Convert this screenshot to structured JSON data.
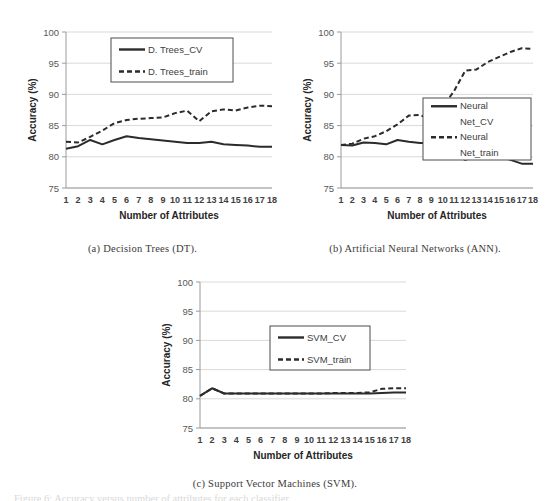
{
  "figure": {
    "subcaption_a": "(a) Decision Trees (DT).",
    "subcaption_b": "(b) Artificial Neural Networks (ANN).",
    "subcaption_c": "(c) Support Vector Machines (SVM).",
    "bottom_cut_text": "Figure 6: Accuracy versus number of attributes for each classifier."
  },
  "chart_data": [
    {
      "id": "dt",
      "type": "line",
      "title": "(a) Decision Trees (DT).",
      "xlabel": "Number of Attributes",
      "ylabel": "Accuracy (%)",
      "xlim": [
        1,
        18
      ],
      "ylim": [
        75,
        100
      ],
      "yticks": [
        75,
        80,
        85,
        90,
        95,
        100
      ],
      "ytick_labels": [
        "75",
        "80",
        "85",
        "90",
        "95",
        "100"
      ],
      "x": [
        1,
        2,
        3,
        4,
        5,
        6,
        7,
        8,
        9,
        10,
        11,
        12,
        13,
        14,
        15,
        16,
        17,
        18
      ],
      "xtick_labels": [
        "1",
        "2",
        "3",
        "4",
        "5",
        "6",
        "7",
        "8",
        "9",
        "10",
        "11",
        "12",
        "13",
        "14",
        "15",
        "16",
        "17",
        "18"
      ],
      "grid": "horizontal",
      "legend_position": "upper-center",
      "series": [
        {
          "name": "D. Trees_CV",
          "style": "solid",
          "color": "#2b2b2b",
          "values": [
            81.3,
            81.7,
            82.7,
            82.0,
            82.7,
            83.3,
            83.0,
            82.8,
            82.6,
            82.4,
            82.2,
            82.2,
            82.4,
            82.0,
            81.9,
            81.8,
            81.6,
            81.6
          ]
        },
        {
          "name": "D. Trees_train",
          "style": "dashed",
          "color": "#2b2b2b",
          "values": [
            82.4,
            82.3,
            83.2,
            84.2,
            85.4,
            85.9,
            86.1,
            86.2,
            86.3,
            87.0,
            87.4,
            85.7,
            87.3,
            87.6,
            87.4,
            87.9,
            88.2,
            88.1
          ]
        }
      ]
    },
    {
      "id": "ann",
      "type": "line",
      "title": "(b) Artificial Neural Networks (ANN).",
      "xlabel": "Number of Attributes",
      "ylabel": "Accuracy (%)",
      "xlim": [
        1,
        18
      ],
      "ylim": [
        75,
        100
      ],
      "yticks": [
        75,
        80,
        85,
        90,
        95,
        100
      ],
      "ytick_labels": [
        "75",
        "80",
        "85",
        "90",
        "95",
        "100"
      ],
      "x": [
        1,
        2,
        3,
        4,
        5,
        6,
        7,
        8,
        9,
        10,
        11,
        12,
        13,
        14,
        15,
        16,
        17,
        18
      ],
      "xtick_labels": [
        "1",
        "2",
        "3",
        "4",
        "5",
        "6",
        "7",
        "8",
        "9",
        "10",
        "11",
        "12",
        "13",
        "14",
        "15",
        "16",
        "17",
        "18"
      ],
      "grid": "horizontal",
      "legend_position": "middle-right",
      "series": [
        {
          "name": "Neural Net_CV",
          "label_lines": [
            "Neural",
            "Net_CV"
          ],
          "style": "solid",
          "color": "#2b2b2b",
          "values": [
            81.9,
            81.8,
            82.3,
            82.2,
            82.0,
            82.7,
            82.4,
            82.2,
            82.2,
            80.7,
            80.4,
            79.5,
            80.1,
            79.9,
            80.1,
            79.5,
            78.9,
            78.9
          ]
        },
        {
          "name": "Neural Net_train",
          "label_lines": [
            "Neural",
            "Net_train"
          ],
          "style": "dashed",
          "color": "#2b2b2b",
          "values": [
            81.9,
            82.1,
            82.9,
            83.3,
            84.1,
            85.2,
            86.6,
            86.7,
            85.9,
            88.0,
            90.5,
            93.8,
            94.0,
            95.2,
            96.0,
            96.8,
            97.4,
            97.3
          ]
        }
      ]
    },
    {
      "id": "svm",
      "type": "line",
      "title": "(c) Support Vector Machines (SVM).",
      "xlabel": "Number of Attributes",
      "ylabel": "Accuracy (%)",
      "xlim": [
        1,
        18
      ],
      "ylim": [
        75,
        100
      ],
      "yticks": [
        75,
        80,
        85,
        90,
        95,
        100
      ],
      "ytick_labels": [
        "75",
        "80",
        "85",
        "90",
        "95",
        "100"
      ],
      "x": [
        1,
        2,
        3,
        4,
        5,
        6,
        7,
        8,
        9,
        10,
        11,
        12,
        13,
        14,
        15,
        16,
        17,
        18
      ],
      "xtick_labels": [
        "1",
        "2",
        "3",
        "4",
        "5",
        "6",
        "7",
        "8",
        "9",
        "10",
        "11",
        "12",
        "13",
        "14",
        "15",
        "16",
        "17",
        "18"
      ],
      "grid": "horizontal",
      "legend_position": "middle-center",
      "series": [
        {
          "name": "SVM_CV",
          "style": "solid",
          "color": "#2b2b2b",
          "values": [
            80.5,
            81.8,
            80.9,
            80.9,
            80.9,
            80.9,
            80.9,
            80.9,
            80.9,
            80.9,
            80.9,
            80.9,
            80.9,
            80.9,
            80.9,
            81.0,
            81.1,
            81.1
          ]
        },
        {
          "name": "SVM_train",
          "style": "dashed",
          "color": "#2b2b2b",
          "values": [
            80.5,
            81.8,
            80.9,
            80.9,
            80.9,
            80.9,
            80.9,
            80.9,
            80.9,
            80.9,
            80.9,
            81.0,
            81.0,
            81.0,
            81.1,
            81.7,
            81.8,
            81.8
          ]
        }
      ]
    }
  ]
}
